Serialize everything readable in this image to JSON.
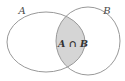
{
  "diagram": {
    "type": "venn-two-sets",
    "set_a_label": "A",
    "set_b_label": "B",
    "intersection_label": "A ∩ B"
  },
  "colors": {
    "background": "#ffffff",
    "outline": "#999999",
    "intersection_fill": "#d5d5d5",
    "set_label_color": "#4a4a4a",
    "intersection_label_color": "#333333"
  }
}
